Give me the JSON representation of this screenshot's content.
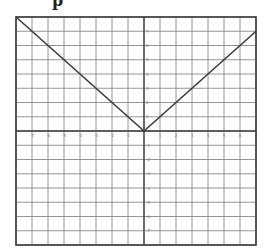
{
  "top_fragment": "p",
  "colors": {
    "grid": "#8a8a8a",
    "border": "#3a3a3a",
    "line": "#3c3c3c",
    "label": "#777777"
  },
  "chart_data": {
    "type": "line",
    "title": "",
    "xlabel": "x",
    "ylabel": "y",
    "function": "y = |x|",
    "xlim": [
      -8,
      7
    ],
    "ylim": [
      -8,
      8
    ],
    "grid": true,
    "legend": null,
    "x_ticks": [
      -7,
      -6,
      -5,
      -4,
      -3,
      -2,
      -1,
      1,
      2,
      3,
      4,
      5,
      6,
      7
    ],
    "y_ticks": [
      7,
      6,
      5,
      4,
      3,
      2,
      1,
      -1,
      -2,
      -3,
      -4,
      -5,
      -6,
      -7
    ],
    "series": [
      {
        "name": "y=|x|",
        "x": [
          -8,
          0,
          7
        ],
        "y": [
          8,
          0,
          7
        ]
      }
    ]
  }
}
